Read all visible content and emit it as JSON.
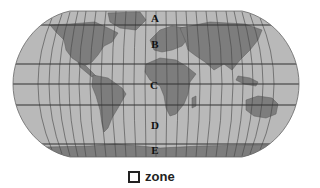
{
  "map": {
    "projection": "world-map-robinson-like",
    "colors": {
      "ocean": "#b9b9b9",
      "land": "#7d7d7d",
      "grid": "#333333",
      "background": "#ffffff"
    },
    "zones": [
      {
        "label": "A",
        "x": 155,
        "y": 18
      },
      {
        "label": "B",
        "x": 155,
        "y": 44
      },
      {
        "label": "C",
        "x": 154,
        "y": 85
      },
      {
        "label": "D",
        "x": 155,
        "y": 125
      },
      {
        "label": "E",
        "x": 155,
        "y": 150
      }
    ],
    "latitude_lines_y": [
      25,
      64,
      84,
      105,
      144
    ]
  },
  "legend": {
    "icon": "hollow-square-icon",
    "label": "zone"
  }
}
